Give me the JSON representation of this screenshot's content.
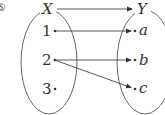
{
  "figure": {
    "marker": "⑤",
    "domain_set": {
      "name": "X",
      "elements": [
        "1",
        "2",
        "3"
      ]
    },
    "codomain_set": {
      "name": "Y",
      "elements": [
        "a",
        "b",
        "c"
      ]
    },
    "mappings": [
      {
        "from": "1",
        "to": "a"
      },
      {
        "from": "2",
        "to": "b"
      },
      {
        "from": "2",
        "to": "c"
      }
    ],
    "colors": {
      "stroke": "#444444",
      "text": "#333333"
    }
  }
}
